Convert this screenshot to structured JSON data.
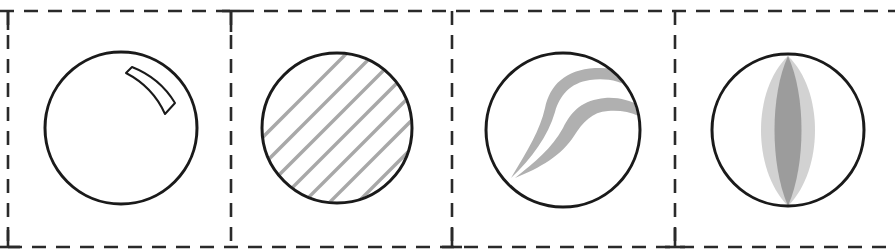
{
  "diagram": {
    "panel_count": 4,
    "frame": {
      "style": "dashed",
      "stroke": "#2a2a2a",
      "dash": "14 10"
    },
    "circle_stroke": "#1a1a1a",
    "panels": [
      {
        "id": "panel-1",
        "content": "circle-with-highlight",
        "description": "Plain sphere with curved specular highlight in upper-right",
        "fill_color": "#ffffff"
      },
      {
        "id": "panel-2",
        "content": "circle-with-diagonal-hatching",
        "description": "Circle filled with gray diagonal hatch lines",
        "hatch_color": "#a8a8a8"
      },
      {
        "id": "panel-3",
        "content": "circle-with-curved-wisps",
        "description": "Circle with two gray curved wisp/streak shapes from lower-left to upper-right",
        "wisp_color": "#b0b0b0"
      },
      {
        "id": "panel-4",
        "content": "circle-with-vertical-lens",
        "description": "Circle with vertical lens/eye shape: light outer and darker inner band",
        "outer_color": "#d0d0d0",
        "inner_color": "#9a9a9a"
      }
    ]
  }
}
